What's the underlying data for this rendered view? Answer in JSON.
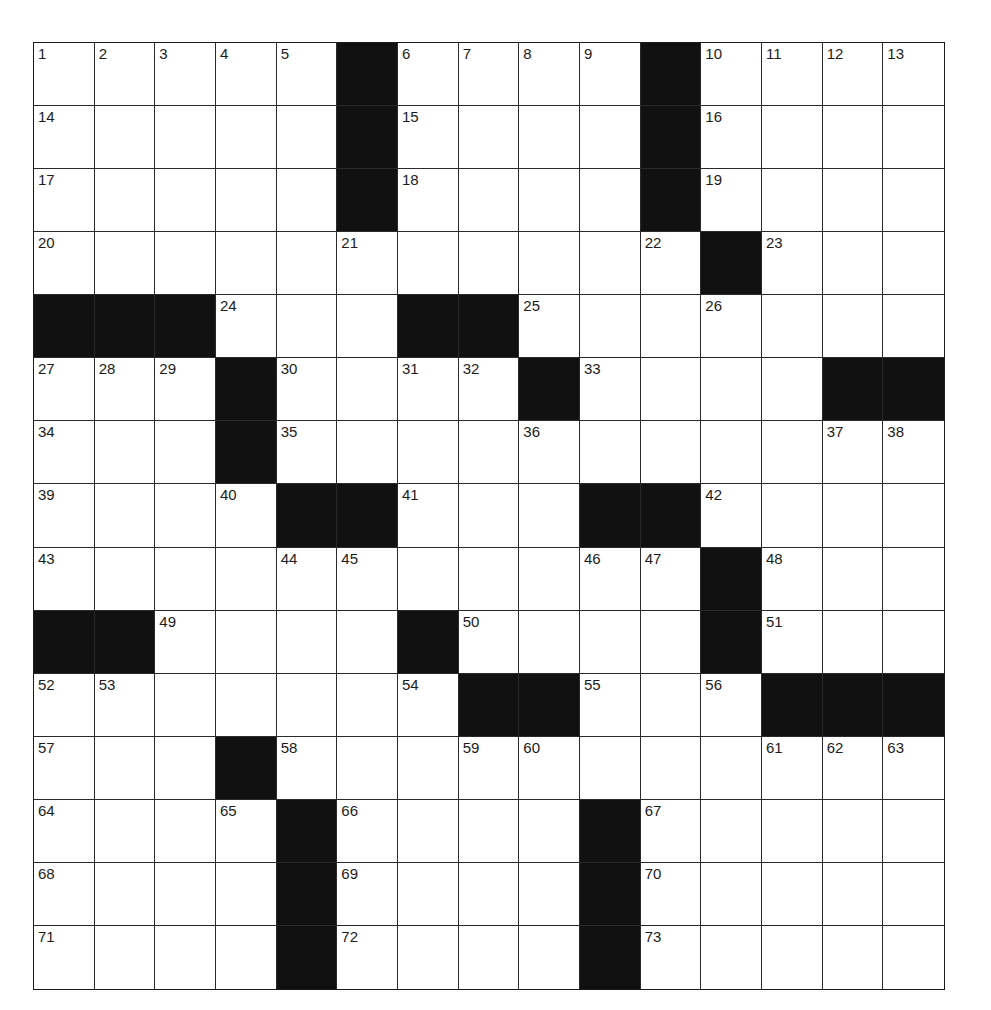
{
  "puzzle": {
    "rows": 15,
    "cols": 15,
    "colors": {
      "block": "#111111",
      "cell": "#ffffff",
      "grid_line": "#2a2a2a",
      "number": "#1c1c1c"
    },
    "blocks": [
      [
        0,
        5
      ],
      [
        0,
        10
      ],
      [
        1,
        5
      ],
      [
        1,
        10
      ],
      [
        2,
        5
      ],
      [
        2,
        10
      ],
      [
        3,
        11
      ],
      [
        4,
        0
      ],
      [
        4,
        1
      ],
      [
        4,
        2
      ],
      [
        4,
        6
      ],
      [
        4,
        7
      ],
      [
        5,
        3
      ],
      [
        5,
        8
      ],
      [
        5,
        13
      ],
      [
        5,
        14
      ],
      [
        6,
        3
      ],
      [
        7,
        4
      ],
      [
        7,
        5
      ],
      [
        7,
        9
      ],
      [
        7,
        10
      ],
      [
        8,
        11
      ],
      [
        9,
        0
      ],
      [
        9,
        1
      ],
      [
        9,
        6
      ],
      [
        9,
        11
      ],
      [
        10,
        7
      ],
      [
        10,
        8
      ],
      [
        10,
        12
      ],
      [
        10,
        13
      ],
      [
        10,
        14
      ],
      [
        11,
        3
      ],
      [
        12,
        4
      ],
      [
        12,
        9
      ],
      [
        13,
        4
      ],
      [
        13,
        9
      ],
      [
        14,
        4
      ],
      [
        14,
        9
      ]
    ],
    "numbers": [
      {
        "r": 0,
        "c": 0,
        "n": "1"
      },
      {
        "r": 0,
        "c": 1,
        "n": "2"
      },
      {
        "r": 0,
        "c": 2,
        "n": "3"
      },
      {
        "r": 0,
        "c": 3,
        "n": "4"
      },
      {
        "r": 0,
        "c": 4,
        "n": "5"
      },
      {
        "r": 0,
        "c": 6,
        "n": "6"
      },
      {
        "r": 0,
        "c": 7,
        "n": "7"
      },
      {
        "r": 0,
        "c": 8,
        "n": "8"
      },
      {
        "r": 0,
        "c": 9,
        "n": "9"
      },
      {
        "r": 0,
        "c": 11,
        "n": "10"
      },
      {
        "r": 0,
        "c": 12,
        "n": "11"
      },
      {
        "r": 0,
        "c": 13,
        "n": "12"
      },
      {
        "r": 0,
        "c": 14,
        "n": "13"
      },
      {
        "r": 1,
        "c": 0,
        "n": "14"
      },
      {
        "r": 1,
        "c": 6,
        "n": "15"
      },
      {
        "r": 1,
        "c": 11,
        "n": "16"
      },
      {
        "r": 2,
        "c": 0,
        "n": "17"
      },
      {
        "r": 2,
        "c": 6,
        "n": "18"
      },
      {
        "r": 2,
        "c": 11,
        "n": "19"
      },
      {
        "r": 3,
        "c": 0,
        "n": "20"
      },
      {
        "r": 3,
        "c": 5,
        "n": "21"
      },
      {
        "r": 3,
        "c": 10,
        "n": "22"
      },
      {
        "r": 3,
        "c": 12,
        "n": "23"
      },
      {
        "r": 4,
        "c": 3,
        "n": "24"
      },
      {
        "r": 4,
        "c": 8,
        "n": "25"
      },
      {
        "r": 4,
        "c": 11,
        "n": "26"
      },
      {
        "r": 5,
        "c": 0,
        "n": "27"
      },
      {
        "r": 5,
        "c": 1,
        "n": "28"
      },
      {
        "r": 5,
        "c": 2,
        "n": "29"
      },
      {
        "r": 5,
        "c": 4,
        "n": "30"
      },
      {
        "r": 5,
        "c": 6,
        "n": "31"
      },
      {
        "r": 5,
        "c": 7,
        "n": "32"
      },
      {
        "r": 5,
        "c": 9,
        "n": "33"
      },
      {
        "r": 6,
        "c": 0,
        "n": "34"
      },
      {
        "r": 6,
        "c": 4,
        "n": "35"
      },
      {
        "r": 6,
        "c": 8,
        "n": "36"
      },
      {
        "r": 6,
        "c": 13,
        "n": "37"
      },
      {
        "r": 6,
        "c": 14,
        "n": "38"
      },
      {
        "r": 7,
        "c": 0,
        "n": "39"
      },
      {
        "r": 7,
        "c": 3,
        "n": "40"
      },
      {
        "r": 7,
        "c": 6,
        "n": "41"
      },
      {
        "r": 7,
        "c": 11,
        "n": "42"
      },
      {
        "r": 8,
        "c": 0,
        "n": "43"
      },
      {
        "r": 8,
        "c": 4,
        "n": "44"
      },
      {
        "r": 8,
        "c": 5,
        "n": "45"
      },
      {
        "r": 8,
        "c": 9,
        "n": "46"
      },
      {
        "r": 8,
        "c": 10,
        "n": "47"
      },
      {
        "r": 8,
        "c": 12,
        "n": "48"
      },
      {
        "r": 9,
        "c": 2,
        "n": "49"
      },
      {
        "r": 9,
        "c": 7,
        "n": "50"
      },
      {
        "r": 9,
        "c": 12,
        "n": "51"
      },
      {
        "r": 10,
        "c": 0,
        "n": "52"
      },
      {
        "r": 10,
        "c": 1,
        "n": "53"
      },
      {
        "r": 10,
        "c": 6,
        "n": "54"
      },
      {
        "r": 10,
        "c": 9,
        "n": "55"
      },
      {
        "r": 10,
        "c": 11,
        "n": "56"
      },
      {
        "r": 11,
        "c": 0,
        "n": "57"
      },
      {
        "r": 11,
        "c": 4,
        "n": "58"
      },
      {
        "r": 11,
        "c": 7,
        "n": "59"
      },
      {
        "r": 11,
        "c": 8,
        "n": "60"
      },
      {
        "r": 11,
        "c": 12,
        "n": "61"
      },
      {
        "r": 11,
        "c": 13,
        "n": "62"
      },
      {
        "r": 11,
        "c": 14,
        "n": "63"
      },
      {
        "r": 12,
        "c": 0,
        "n": "64"
      },
      {
        "r": 12,
        "c": 3,
        "n": "65"
      },
      {
        "r": 12,
        "c": 5,
        "n": "66"
      },
      {
        "r": 12,
        "c": 10,
        "n": "67"
      },
      {
        "r": 13,
        "c": 0,
        "n": "68"
      },
      {
        "r": 13,
        "c": 5,
        "n": "69"
      },
      {
        "r": 13,
        "c": 10,
        "n": "70"
      },
      {
        "r": 14,
        "c": 0,
        "n": "71"
      },
      {
        "r": 14,
        "c": 5,
        "n": "72"
      },
      {
        "r": 14,
        "c": 10,
        "n": "73"
      }
    ],
    "entries": []
  }
}
